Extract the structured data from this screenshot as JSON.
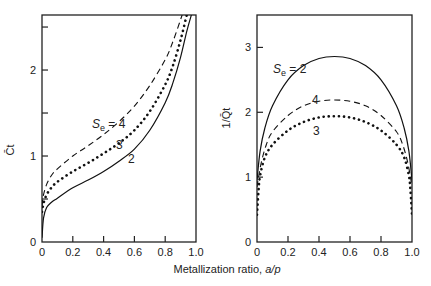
{
  "xlabel_prefix": "Metallization ratio, ",
  "xlabel_var": "a/p",
  "chart_data": [
    {
      "type": "line",
      "panel": "left",
      "ylabel": "C̄t",
      "xlabel": "Metallization ratio, a/p",
      "xlim": [
        0,
        1.0
      ],
      "ylim": [
        0,
        2.64
      ],
      "xticks": [
        0,
        0.2,
        0.4,
        0.6,
        0.8,
        1.0
      ],
      "xtick_labels": [
        "0",
        "0.2",
        "0.4",
        "0.6",
        "0.8",
        "1.0"
      ],
      "yticks": [
        0,
        0.5,
        1,
        1.5,
        2,
        2.5
      ],
      "yticks_labeled": [
        0,
        1,
        2
      ],
      "ytick_labels": [
        "0",
        "1",
        "2"
      ],
      "grid": false,
      "annotations": [
        {
          "text": "Se = 4",
          "series": "Se=4"
        },
        {
          "text": "3",
          "series": "Se=3"
        },
        {
          "text": "2",
          "series": "Se=2"
        }
      ],
      "series": [
        {
          "name": "Se=2",
          "style": "solid",
          "x": [
            0,
            0.01,
            0.03,
            0.06,
            0.1,
            0.2,
            0.3,
            0.4,
            0.5,
            0.6,
            0.7,
            0.8,
            0.85,
            0.9,
            0.94,
            0.97
          ],
          "y": [
            0.05,
            0.28,
            0.4,
            0.46,
            0.51,
            0.63,
            0.72,
            0.82,
            0.94,
            1.08,
            1.3,
            1.62,
            1.85,
            2.15,
            2.45,
            2.64
          ]
        },
        {
          "name": "Se=3",
          "style": "dotted",
          "x": [
            0,
            0.01,
            0.03,
            0.06,
            0.1,
            0.2,
            0.3,
            0.4,
            0.5,
            0.6,
            0.7,
            0.8,
            0.85,
            0.9,
            0.94
          ],
          "y": [
            0.35,
            0.45,
            0.55,
            0.63,
            0.7,
            0.82,
            0.92,
            1.03,
            1.15,
            1.3,
            1.52,
            1.83,
            2.05,
            2.35,
            2.64
          ]
        },
        {
          "name": "Se=4",
          "style": "dashed",
          "x": [
            0,
            0.01,
            0.03,
            0.06,
            0.1,
            0.2,
            0.3,
            0.4,
            0.5,
            0.6,
            0.7,
            0.8,
            0.85,
            0.91
          ],
          "y": [
            0.42,
            0.55,
            0.67,
            0.77,
            0.85,
            1.0,
            1.12,
            1.25,
            1.4,
            1.58,
            1.82,
            2.12,
            2.33,
            2.64
          ]
        }
      ]
    },
    {
      "type": "line",
      "panel": "right",
      "ylabel": "1/Q̄t",
      "xlabel": "Metallization ratio, a/p",
      "xlim": [
        0,
        1.0
      ],
      "ylim": [
        0,
        3.5
      ],
      "xticks": [
        0,
        0.2,
        0.4,
        0.6,
        0.8,
        1.0
      ],
      "xtick_labels": [
        "0",
        "0.2",
        "0.4",
        "0.6",
        "0.8",
        "1.0"
      ],
      "yticks": [
        0,
        1,
        2,
        3
      ],
      "ytick_labels": [
        "0",
        "1",
        "2",
        "3"
      ],
      "grid": false,
      "annotations": [
        {
          "text": "Se = 2",
          "series": "Se=2"
        },
        {
          "text": "4",
          "series": "Se=4"
        },
        {
          "text": "3",
          "series": "Se=3"
        }
      ],
      "series": [
        {
          "name": "Se=2",
          "style": "solid",
          "x": [
            0,
            0.02,
            0.05,
            0.1,
            0.2,
            0.3,
            0.4,
            0.5,
            0.6,
            0.7,
            0.8,
            0.9,
            0.95,
            0.98,
            1.0
          ],
          "y": [
            0.95,
            1.4,
            1.75,
            2.1,
            2.5,
            2.72,
            2.83,
            2.86,
            2.83,
            2.72,
            2.5,
            2.1,
            1.75,
            1.4,
            0.95
          ]
        },
        {
          "name": "Se=3",
          "style": "dotted",
          "x": [
            0,
            0.01,
            0.02,
            0.05,
            0.1,
            0.2,
            0.3,
            0.4,
            0.5,
            0.6,
            0.7,
            0.8,
            0.9,
            0.95,
            0.98,
            0.99,
            1.0
          ],
          "y": [
            0.42,
            0.8,
            1.02,
            1.3,
            1.5,
            1.72,
            1.85,
            1.92,
            1.94,
            1.92,
            1.85,
            1.72,
            1.5,
            1.3,
            1.02,
            0.8,
            0.42
          ]
        },
        {
          "name": "Se=4",
          "style": "dashed",
          "x": [
            0,
            0.01,
            0.03,
            0.06,
            0.1,
            0.2,
            0.3,
            0.4,
            0.5,
            0.6,
            0.7,
            0.8,
            0.9,
            0.94,
            0.97,
            0.99,
            1.0
          ],
          "y": [
            0.85,
            1.0,
            1.25,
            1.5,
            1.7,
            1.95,
            2.1,
            2.17,
            2.19,
            2.17,
            2.1,
            1.95,
            1.7,
            1.5,
            1.25,
            1.0,
            0.85
          ]
        }
      ]
    }
  ]
}
